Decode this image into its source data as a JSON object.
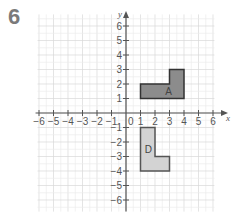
{
  "question_number": "6",
  "chart_data": {
    "type": "coordinate-grid",
    "x_axis": {
      "label": "x",
      "min": -6,
      "max": 6,
      "ticks": [
        -6,
        -5,
        -4,
        -3,
        -2,
        -1,
        0,
        1,
        2,
        3,
        4,
        5,
        6
      ]
    },
    "y_axis": {
      "label": "y",
      "min": -6,
      "max": 6,
      "ticks": [
        6,
        5,
        4,
        3,
        2,
        1,
        -1,
        -2,
        -3,
        -4,
        -5,
        -6
      ]
    },
    "grid": true,
    "shapes": [
      {
        "name": "A",
        "fill": "#8c8c8c",
        "stroke": "#333333",
        "vertices": [
          [
            1,
            1
          ],
          [
            4,
            1
          ],
          [
            4,
            3
          ],
          [
            3,
            3
          ],
          [
            3,
            2
          ],
          [
            1,
            2
          ]
        ],
        "label_pos": [
          2.7,
          1.5
        ]
      },
      {
        "name": "D",
        "fill": "#d3d3d3",
        "stroke": "#555555",
        "vertices": [
          [
            1,
            -1
          ],
          [
            2,
            -1
          ],
          [
            2,
            -3
          ],
          [
            3,
            -3
          ],
          [
            3,
            -4
          ],
          [
            1,
            -4
          ]
        ],
        "label_pos": [
          1.3,
          -2.5
        ]
      }
    ]
  },
  "labels": {
    "x_axis": "x",
    "y_axis": "y",
    "shape_a": "A",
    "shape_d": "D",
    "origin": "0"
  }
}
